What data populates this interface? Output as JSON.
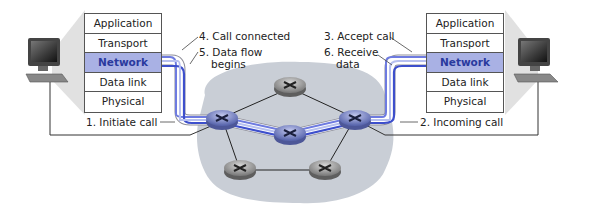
{
  "diagram": {
    "type": "virtual-circuit setup",
    "left_host": {
      "stack": [
        "Application",
        "Transport",
        "Network",
        "Data link",
        "Physical"
      ],
      "highlighted_layer": "Network"
    },
    "right_host": {
      "stack": [
        "Application",
        "Transport",
        "Network",
        "Data link",
        "Physical"
      ],
      "highlighted_layer": "Network"
    },
    "labels": {
      "initiate": "1. Initiate call",
      "incoming": "2. Incoming call",
      "accept": "3. Accept call",
      "connected": "4. Call connected",
      "dataflow_1": "5. Data flow",
      "dataflow_2": "begins",
      "receive_1": "6. Receive",
      "receive_2": "data"
    },
    "routers": 6,
    "colors": {
      "path": "#4a5bd0",
      "path_light": "#b7c0f0",
      "network_cloud": "#c9ced6",
      "highlight_layer": "#a9b1e4",
      "router_active": "#6f7bb8",
      "router_idle": "#8a8a8a"
    }
  }
}
